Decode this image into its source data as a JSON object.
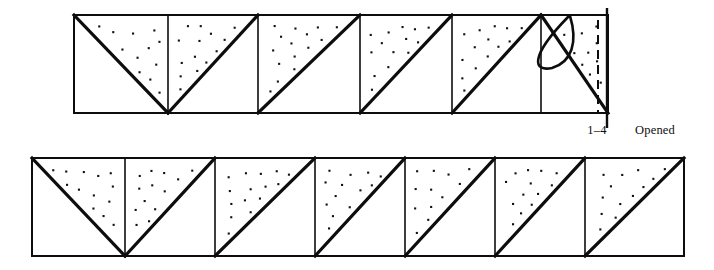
{
  "figure": {
    "background_color": "#ffffff",
    "ink_color": "#0d0d0d",
    "stipple_color": "#111111",
    "stroke_weights": {
      "frame": 2.6,
      "divider": 1.6,
      "diagonal": 3.2,
      "arc": 2.6,
      "edge_marker": 2.4,
      "dashed": 2.0
    }
  },
  "labels": {
    "range_label": "1–4",
    "state_label": "Opened"
  },
  "strips": [
    {
      "id": "upper-strip",
      "name": "upper-row",
      "x": 74,
      "y": 15,
      "width": 534,
      "height": 98,
      "dividers": [
        168,
        258,
        360,
        452,
        541
      ],
      "has_right_edge_marker": true,
      "has_dashed_right_edge": true,
      "has_fold_arc": true,
      "cells": [
        {
          "index": 1,
          "diagonal": "tl-br",
          "stipple": "upper"
        },
        {
          "index": 2,
          "diagonal": "bl-tr",
          "stipple": "upper"
        },
        {
          "index": 3,
          "diagonal": "bl-tr",
          "stipple": "upper-left"
        },
        {
          "index": 4,
          "diagonal": "bl-tr",
          "stipple": "upper-left"
        },
        {
          "index": 5,
          "diagonal": "bl-tr",
          "stipple": "upper-left"
        },
        {
          "index": 6,
          "diagonal": "tl-br",
          "stipple": "upper-right"
        }
      ]
    },
    {
      "id": "lower-strip",
      "name": "lower-row",
      "x": 32,
      "y": 158,
      "width": 652,
      "height": 98,
      "dividers": [
        125,
        215,
        315,
        405,
        495,
        585
      ],
      "has_right_edge_marker": false,
      "has_dashed_right_edge": false,
      "has_fold_arc": false,
      "cells": [
        {
          "index": 1,
          "diagonal": "tl-br",
          "stipple": "upper"
        },
        {
          "index": 2,
          "diagonal": "bl-tr",
          "stipple": "upper"
        },
        {
          "index": 3,
          "diagonal": "bl-tr",
          "stipple": "upper-left"
        },
        {
          "index": 4,
          "diagonal": "bl-tr",
          "stipple": "upper-left"
        },
        {
          "index": 5,
          "diagonal": "bl-tr",
          "stipple": "upper-left"
        },
        {
          "index": 6,
          "diagonal": "bl-tr",
          "stipple": "upper-left"
        },
        {
          "index": 7,
          "diagonal": "bl-tr",
          "stipple": "upper-left"
        }
      ]
    }
  ],
  "edge_marker": {
    "x": 607,
    "y_top": 8,
    "y_bottom": 128
  },
  "dashed_edge": {
    "x": 598,
    "y_top": 20,
    "y_bottom": 112
  },
  "fold_arc": {
    "start_x": 570,
    "start_y": 16,
    "end_x": 548,
    "end_y": 62
  },
  "label_positions": {
    "range_label": {
      "x": 597,
      "y": 134
    },
    "state_label": {
      "x": 655,
      "y": 134
    }
  }
}
